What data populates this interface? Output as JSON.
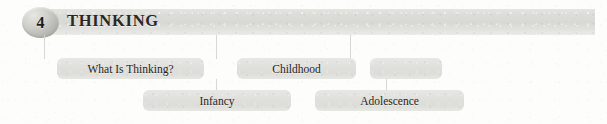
{
  "chapter": {
    "number": "4",
    "title": "THINKING"
  },
  "colors": {
    "page_background": "#fdfdfc",
    "header_bar": "#dcdcd9",
    "badge": "#bdbdb8",
    "box_fill": "#e1e1de",
    "connector_line": "#d7d7d4",
    "text": "#262320"
  },
  "outline": {
    "row1": [
      {
        "label": "What Is Thinking?",
        "left": 57,
        "top": 58,
        "width": 147
      },
      {
        "label": "Childhood",
        "left": 237,
        "top": 58,
        "width": 119
      },
      {
        "label": "",
        "left": 370,
        "top": 58,
        "width": 72
      }
    ],
    "row2": [
      {
        "label": "Infancy",
        "left": 143,
        "top": 90,
        "width": 148
      },
      {
        "label": "Adolescence",
        "left": 315,
        "top": 90,
        "width": 149
      }
    ]
  },
  "connectors": [
    {
      "name": "connector-to-what-is-thinking",
      "left": 44,
      "top": 35,
      "height": 24
    },
    {
      "name": "connector-to-childhood",
      "left": 216,
      "top": 35,
      "height": 24
    },
    {
      "name": "connector-to-infancy",
      "left": 216,
      "top": 79,
      "height": 12
    },
    {
      "name": "connector-to-adolescence-upper",
      "left": 350,
      "top": 35,
      "height": 24
    },
    {
      "name": "connector-to-adolescence",
      "left": 386,
      "top": 79,
      "height": 12
    }
  ]
}
